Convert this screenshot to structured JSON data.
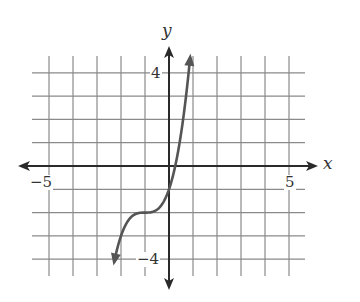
{
  "chart_data": {
    "type": "line",
    "title": "",
    "xlabel": "x",
    "ylabel": "y",
    "xlim": [
      -5.5,
      5.5
    ],
    "ylim": [
      -4.5,
      4.5
    ],
    "grid": true,
    "x_tick_labels": [
      {
        "value": -5,
        "label": "−5"
      },
      {
        "value": 5,
        "label": "5"
      }
    ],
    "y_tick_labels": [
      {
        "value": 4,
        "label": "4"
      },
      {
        "value": -4,
        "label": "−4"
      }
    ],
    "function": "y = (x + 1)^3 - 2",
    "series": [
      {
        "name": "curve",
        "x": [
          -2.3,
          -2.0,
          -1.5,
          -1.0,
          -0.5,
          0.0,
          0.25,
          0.5,
          0.9
        ],
        "y": [
          -4.2,
          -3.0,
          -2.1,
          -2.0,
          -1.9,
          -1.0,
          -0.05,
          1.4,
          4.6
        ]
      }
    ],
    "arrows_on_ends": true
  },
  "labels": {
    "x_axis": "x",
    "y_axis": "y",
    "x_neg5": "−5",
    "x_pos5": "5",
    "y_pos4": "4",
    "y_neg4": "−4"
  },
  "colors": {
    "grid": "#8a8a8a",
    "axis": "#2a2a2a",
    "curve": "#555555",
    "text": "#333333"
  }
}
